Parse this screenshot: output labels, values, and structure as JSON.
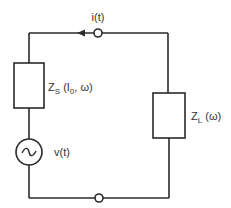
{
  "diagram": {
    "type": "circuit",
    "current_label": "i(t)",
    "source_label": "v(t)",
    "source_symbol": "~",
    "source_impedance": {
      "main": "Z",
      "sub": "S",
      "args_pre": " (I",
      "args_sub": "0",
      "args_post": ", ω)"
    },
    "load_impedance": {
      "main": "Z",
      "sub": "L",
      "args": " (ω)"
    },
    "stroke_color": "#2a2a2a"
  }
}
